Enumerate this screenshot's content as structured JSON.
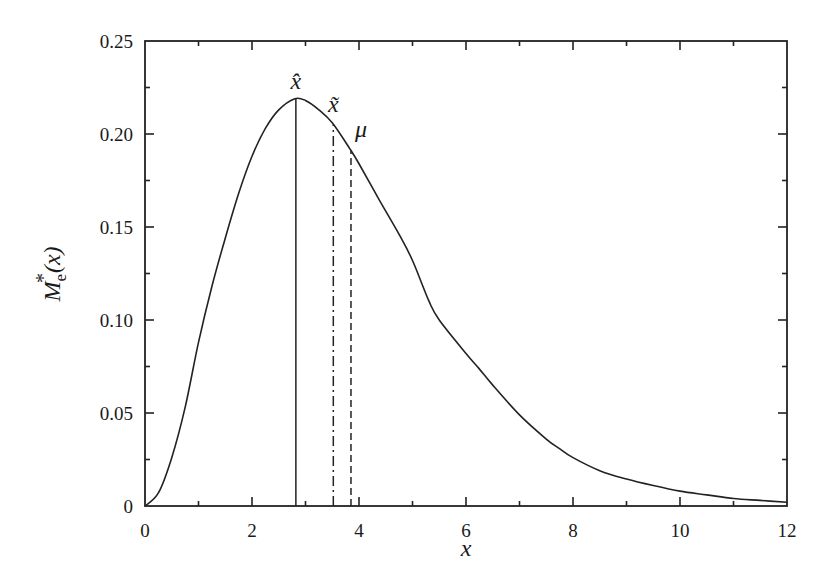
{
  "chart_data": {
    "type": "line",
    "title": "",
    "xlabel": "x",
    "ylabel": "M_e*(x)",
    "ylabel_parts": {
      "base": "M",
      "sub": "e",
      "sup": "*",
      "arg": "(x)"
    },
    "xlim": [
      0,
      12
    ],
    "ylim": [
      0,
      0.25
    ],
    "grid": false,
    "x_ticks": [
      0,
      2,
      4,
      6,
      8,
      10,
      12
    ],
    "x_tick_labels": [
      "0",
      "2",
      "4",
      "6",
      "8",
      "10",
      "12"
    ],
    "x_minor_ticks": [
      1,
      3,
      5,
      7,
      9,
      11
    ],
    "y_ticks": [
      0,
      0.05,
      0.1,
      0.15,
      0.2,
      0.25
    ],
    "y_tick_labels": [
      "0",
      "0.05",
      "0.10",
      "0.15",
      "0.20",
      "0.25"
    ],
    "y_minor_ticks": [
      0.025,
      0.075,
      0.125,
      0.175,
      0.225
    ],
    "series": [
      {
        "name": "M_e*(x)",
        "style": "solid",
        "x": [
          0,
          0.25,
          0.5,
          0.75,
          1.0,
          1.25,
          1.5,
          1.75,
          2.0,
          2.25,
          2.5,
          2.8,
          3.0,
          3.25,
          3.5,
          3.83,
          4.0,
          4.37,
          4.75,
          5.0,
          5.31,
          5.5,
          6.0,
          6.24,
          6.5,
          7.0,
          7.5,
          7.74,
          8.0,
          8.5,
          9.0,
          9.5,
          10.0,
          10.5,
          11.0,
          11.5,
          12.0
        ],
        "y": [
          0,
          0.007,
          0.026,
          0.053,
          0.088,
          0.118,
          0.144,
          0.168,
          0.188,
          0.203,
          0.213,
          0.219,
          0.218,
          0.213,
          0.206,
          0.192,
          0.184,
          0.165,
          0.146,
          0.132,
          0.11,
          0.1,
          0.082,
          0.074,
          0.065,
          0.049,
          0.036,
          0.031,
          0.026,
          0.019,
          0.0145,
          0.011,
          0.008,
          0.006,
          0.004,
          0.003,
          0.002
        ]
      }
    ],
    "markers": [
      {
        "name": "mode",
        "label": "x̂",
        "x": 2.82,
        "style": "solid"
      },
      {
        "name": "median",
        "label": "x̃",
        "x": 3.52,
        "style": "dash-dot"
      },
      {
        "name": "mean",
        "label": "μ",
        "x": 3.85,
        "style": "dashed"
      }
    ]
  }
}
